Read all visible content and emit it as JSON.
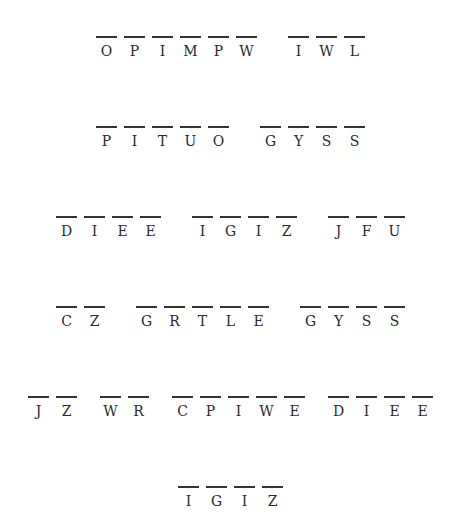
{
  "puzzle": {
    "type": "cryptogram",
    "lines": [
      {
        "words": [
          "OPIMPW",
          "IWL"
        ]
      },
      {
        "words": [
          "PITUO",
          "GYSS"
        ]
      },
      {
        "words": [
          "DIEE",
          "IGIZ",
          "JFU"
        ]
      },
      {
        "words": [
          "CZ",
          "GRTLE",
          "GYSS"
        ]
      },
      {
        "words": [
          "JZ",
          "WR",
          "CPIWE",
          "DIEE"
        ]
      },
      {
        "words": [
          "IGIZ"
        ]
      }
    ]
  }
}
